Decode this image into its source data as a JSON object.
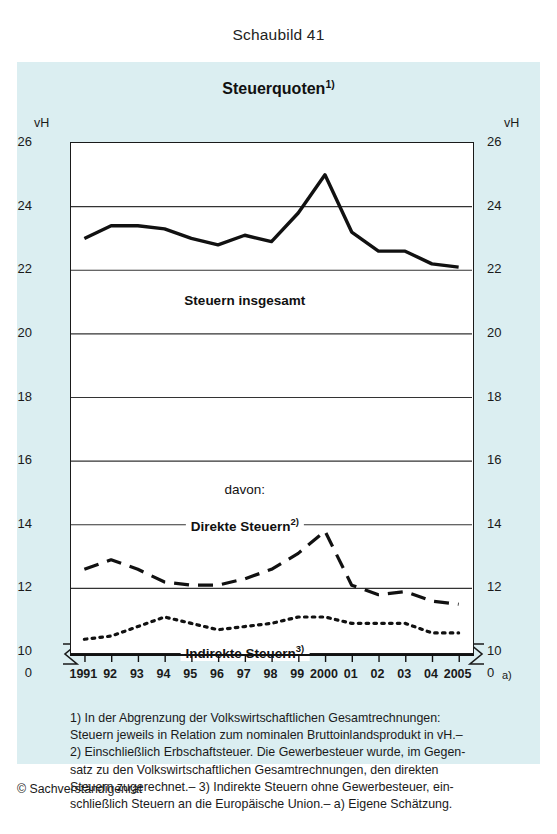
{
  "figure_number": "Schaubild 41",
  "chart_title": "Steuerquoten",
  "chart_title_sup": "1)",
  "unit_left": "vH",
  "unit_right": "vH",
  "zero_left": "0",
  "zero_right": "0",
  "captions": {
    "total": "Steuern insgesamt",
    "davon": "davon:",
    "direct": "Direkte Steuern",
    "direct_sup": "2)",
    "indirect": "Indirekte Steuern",
    "indirect_sup": "3)"
  },
  "xaxis_footnote_marker": "a)",
  "footnotes": [
    "1) In der Abgrenzung der Volkswirtschaftlichen Gesamtrechnungen:",
    "Steuern jeweils in Relation zum nominalen Bruttoinlandsprodukt in vH.–",
    "2) Einschließlich Erbschaftsteuer. Die Gewerbesteuer wurde, im Gegen-",
    "satz zu den Volkswirtschaftlichen Gesamtrechnungen, den direkten",
    "Steuern zugerechnet.– 3) Indirekte Steuern ohne Gewerbesteuer, ein-",
    "schließlich Steuern an die Europäische Union.– a) Eigene Schätzung."
  ],
  "copyright": "© Sachverständigenrat",
  "colors": {
    "panel_background": "#dbeef1",
    "plot_background": "#ffffff",
    "line": "#111111",
    "gridline": "#333333",
    "text": "#1a1a1a"
  },
  "chart_data": {
    "type": "line",
    "title": "Steuerquoten",
    "xlabel": "",
    "ylabel": "vH",
    "ylim": [
      10,
      26
    ],
    "ytick_values": [
      10,
      12,
      14,
      16,
      18,
      20,
      22,
      24,
      26
    ],
    "ytick_labels": [
      "10",
      "12",
      "14",
      "16",
      "18",
      "20",
      "22",
      "24",
      "26"
    ],
    "y_axis_break_below": 10,
    "y_origin_label": "0",
    "grid": true,
    "grid_axis": "y",
    "legend": "inline-annotations",
    "x": [
      1991,
      1992,
      1993,
      1994,
      1995,
      1996,
      1997,
      1998,
      1999,
      2000,
      2001,
      2002,
      2003,
      2004,
      2005
    ],
    "xtick_labels": [
      "1991",
      "92",
      "93",
      "94",
      "95",
      "96",
      "97",
      "98",
      "99",
      "2000",
      "01",
      "02",
      "03",
      "04",
      "2005"
    ],
    "series": [
      {
        "name": "Steuern insgesamt",
        "style": "solid",
        "width": 3.4,
        "values": [
          23.0,
          23.4,
          23.4,
          23.3,
          23.0,
          22.8,
          23.1,
          22.9,
          23.8,
          25.0,
          23.2,
          22.6,
          22.6,
          22.2,
          22.1
        ]
      },
      {
        "name": "Direkte Steuern",
        "style": "dashed",
        "width": 3.2,
        "values": [
          12.6,
          12.9,
          12.6,
          12.2,
          12.1,
          12.1,
          12.3,
          12.6,
          13.1,
          13.8,
          12.1,
          11.8,
          11.9,
          11.6,
          11.5
        ]
      },
      {
        "name": "Indirekte Steuern",
        "style": "dotted",
        "width": 3.2,
        "values": [
          10.4,
          10.5,
          10.8,
          11.1,
          10.9,
          10.7,
          10.8,
          10.9,
          11.1,
          11.1,
          10.9,
          10.9,
          10.9,
          10.6,
          10.6
        ]
      }
    ],
    "annotations": [
      {
        "text": "Steuern insgesamt",
        "x": 1997.0,
        "y": 21.0
      },
      {
        "text": "davon:",
        "x": 1997.0,
        "y": 15.0
      },
      {
        "text": "Direkte Steuern2)",
        "x": 1997.0,
        "y": 14.0
      },
      {
        "text": "Indirekte Steuern3)",
        "x": 1997.0,
        "y": 10.0
      }
    ]
  }
}
